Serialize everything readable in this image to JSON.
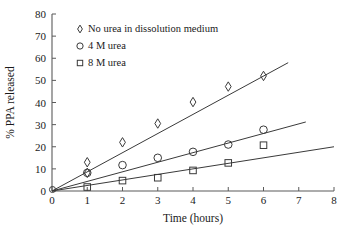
{
  "chart_data": {
    "type": "scatter",
    "title": "",
    "xlabel": "Time (hours)",
    "ylabel": "% PPA released",
    "xlim": [
      0,
      8
    ],
    "ylim": [
      0,
      80
    ],
    "xticks": [
      0,
      1,
      2,
      3,
      4,
      5,
      6,
      7,
      8
    ],
    "yticks": [
      0,
      10,
      20,
      30,
      40,
      50,
      60,
      70,
      80
    ],
    "grid": false,
    "legend_position": "upper-left-inside",
    "series": [
      {
        "name": "No urea in dissolution medium",
        "marker": "diamond",
        "x": [
          0,
          1,
          1,
          2,
          3,
          4,
          5,
          6
        ],
        "y": [
          0,
          13.0,
          8.2,
          22.0,
          30.5,
          40.2,
          47.2,
          52.0
        ],
        "trend": {
          "x0": 0,
          "y0": 0,
          "x1": 6.7,
          "y1": 58.0
        }
      },
      {
        "name": "4 M urea",
        "marker": "circle",
        "x": [
          0,
          1,
          2,
          3,
          4,
          5,
          6
        ],
        "y": [
          0,
          8.2,
          11.7,
          15.0,
          17.7,
          21.0,
          27.7
        ],
        "trend": {
          "x0": 0,
          "y0": 0,
          "x1": 7.2,
          "y1": 31.2
        }
      },
      {
        "name": "8 M urea",
        "marker": "square",
        "x": [
          0,
          1,
          2,
          3,
          4,
          5,
          6
        ],
        "y": [
          0,
          1.8,
          4.7,
          6.0,
          9.3,
          12.7,
          20.7
        ],
        "trend": {
          "x0": 0,
          "y0": 0,
          "x1": 8.0,
          "y1": 20.0
        }
      }
    ]
  },
  "axes": {
    "x_tick_labels": [
      "0",
      "1",
      "2",
      "3",
      "4",
      "5",
      "6",
      "7",
      "8"
    ],
    "y_tick_labels": [
      "0",
      "10",
      "20",
      "30",
      "40",
      "50",
      "60",
      "70",
      "80"
    ],
    "x_axis_title": "Time (hours)",
    "y_axis_title": "% PPA released"
  },
  "legend": {
    "items": [
      {
        "marker": "diamond",
        "label": "No urea in dissolution medium"
      },
      {
        "marker": "circle",
        "label": "4 M urea"
      },
      {
        "marker": "square",
        "label": "8 M urea"
      }
    ]
  },
  "colors": {
    "axis": "#5a5a5a",
    "data": "#3a3a3a",
    "text": "#1a1a1a",
    "background": "#ffffff"
  }
}
